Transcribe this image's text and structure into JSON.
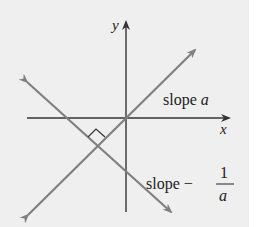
{
  "axes": {
    "x_label": "x",
    "y_label": "y"
  },
  "lines": [
    {
      "name": "line-slope-a",
      "label_prefix": "slope ",
      "label_var": "a"
    },
    {
      "name": "line-slope-neg-recip",
      "label_prefix": "slope −",
      "numerator": "1",
      "denominator": "a"
    }
  ],
  "colors": {
    "background": "#efefef",
    "line": "#808080",
    "axis": "#333333"
  }
}
